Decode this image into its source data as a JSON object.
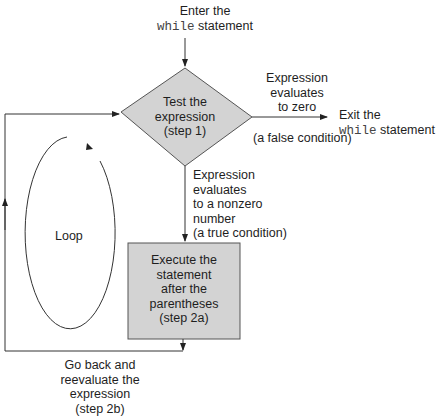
{
  "diagram": {
    "type": "flowchart",
    "entry": {
      "line1": "Enter the",
      "keyword": "while",
      "suffix": " statement"
    },
    "decision": {
      "line1": "Test the",
      "line2": "expression",
      "line3": "(step 1)"
    },
    "false_branch": {
      "line1": "Expression",
      "line2": "evaluates",
      "line3": "to zero",
      "condition": "(a false condition)"
    },
    "exit": {
      "line1": "Exit the",
      "keyword": "while",
      "suffix": " statement"
    },
    "true_branch": {
      "line1": "Expression",
      "line2": "evaluates",
      "line3": "to a nonzero",
      "line4": "number",
      "condition": "(a true condition)"
    },
    "process": {
      "line1": "Execute the",
      "line2": "statement",
      "line3": "after the",
      "line4": "parentheses",
      "line5": "(step 2a)"
    },
    "loop_label": "Loop",
    "return": {
      "line1": "Go back and",
      "line2": "reevaluate the",
      "line3": "expression",
      "line4": "(step 2b)"
    },
    "colors": {
      "shape_fill": "#d3d3d3",
      "line": "#333333"
    }
  }
}
